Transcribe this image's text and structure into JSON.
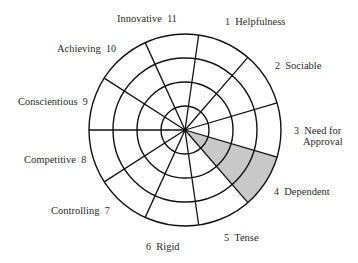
{
  "diagram": {
    "type": "segmented-wheel",
    "center": [
      185,
      130
    ],
    "ring_radii": [
      24,
      48,
      72,
      96
    ],
    "segment_count": 11,
    "stroke_color": "#111111",
    "fill_color": "#c8c8c8",
    "shaded_segment": 4,
    "spoke_angles_deg": [
      180,
      147.3,
      114.5,
      81.8,
      49.1,
      16.4,
      -16.4,
      -49.1,
      -81.8,
      -114.5,
      -147.3
    ]
  },
  "labels": [
    {
      "num": "1",
      "text": "Helpfulness"
    },
    {
      "num": "2",
      "text": "Sociable"
    },
    {
      "num": "3",
      "text": "Need for",
      "text2": "Approval"
    },
    {
      "num": "4",
      "text": "Dependent"
    },
    {
      "num": "5",
      "text": "Tense"
    },
    {
      "num": "6",
      "text": "Rigid"
    },
    {
      "num": "7",
      "text": "Controlling"
    },
    {
      "num": "8",
      "text": "Competitive"
    },
    {
      "num": "9",
      "text": "Conscientious"
    },
    {
      "num": "10",
      "text": "Achieving"
    },
    {
      "num": "11",
      "text": "Innovative"
    }
  ]
}
